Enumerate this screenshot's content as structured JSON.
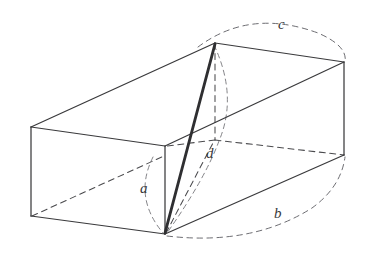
{
  "figure": {
    "background_color": "#ffffff",
    "stroke_color": "#3a3a3c",
    "hidden_stroke_color": "#4a4a4d",
    "arc_stroke_color": "#6d6d72",
    "diagonal_color": "#2f2f31",
    "labels": [
      {
        "id": "a",
        "text": "a",
        "x": 140,
        "y": 181
      },
      {
        "id": "b",
        "text": "b",
        "x": 274,
        "y": 206
      },
      {
        "id": "c",
        "text": "c",
        "x": 278,
        "y": 17
      },
      {
        "id": "d",
        "text": "d",
        "x": 206,
        "y": 146
      }
    ],
    "vertices": {
      "front_top_left": [
        31,
        127
      ],
      "front_bottom_left": [
        31,
        216
      ],
      "front_top_right": [
        165,
        146
      ],
      "front_bottom_right": [
        165,
        234
      ],
      "back_top_left": [
        215,
        43
      ],
      "back_top_right": [
        344,
        62
      ],
      "back_bottom_right": [
        344,
        155
      ],
      "back_bottom_left_hidden": [
        215,
        140
      ]
    },
    "edges": {
      "solid": [
        [
          [
            31,
            127
          ],
          [
            215,
            43
          ]
        ],
        [
          [
            215,
            43
          ],
          [
            344,
            62
          ]
        ],
        [
          [
            344,
            62
          ],
          [
            165,
            146
          ]
        ],
        [
          [
            165,
            146
          ],
          [
            31,
            127
          ]
        ],
        [
          [
            31,
            127
          ],
          [
            31,
            216
          ]
        ],
        [
          [
            165,
            146
          ],
          [
            165,
            234
          ]
        ],
        [
          [
            344,
            62
          ],
          [
            344,
            155
          ]
        ],
        [
          [
            31,
            216
          ],
          [
            165,
            234
          ]
        ],
        [
          [
            165,
            234
          ],
          [
            344,
            155
          ]
        ]
      ],
      "hidden": [
        [
          [
            215,
            43
          ],
          [
            215,
            140
          ]
        ],
        [
          [
            215,
            140
          ],
          [
            344,
            155
          ]
        ],
        [
          [
            215,
            140
          ],
          [
            165,
            146
          ]
        ],
        [
          [
            165,
            234
          ],
          [
            215,
            140
          ]
        ],
        [
          [
            31,
            216
          ],
          [
            165,
            156
          ]
        ]
      ]
    },
    "arcs": {
      "arc_c": "M 198 47 Q 250 8 318 33 Q 348 46 345 62",
      "arc_b": "M 167 236 Q 252 246 312 208 Q 341 187 345 157",
      "arc_a": "M 153 157 Q 134 197 163 233",
      "arc_d": "M 214 45 Q 237 95 219 140 Q 205 178 167 233"
    }
  }
}
